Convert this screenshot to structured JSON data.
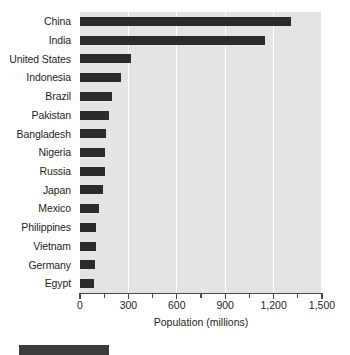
{
  "chart_data": {
    "type": "bar",
    "orientation": "horizontal",
    "title": "",
    "xlabel": "Population (millions)",
    "ylabel": "",
    "xlim": [
      0,
      1500
    ],
    "xticks": [
      0,
      300,
      600,
      900,
      1200,
      1500
    ],
    "xtick_labels": [
      "0",
      "300",
      "600",
      "900",
      "1,200",
      "1,500"
    ],
    "minor_xticks": [
      150,
      450,
      750,
      1050,
      1350
    ],
    "grid": "vertical-major-only",
    "legend": "none",
    "categories": [
      "China",
      "India",
      "United States",
      "Indonesia",
      "Brazil",
      "Pakistan",
      "Bangladesh",
      "Nigeria",
      "Russia",
      "Japan",
      "Mexico",
      "Philippines",
      "Vietnam",
      "Germany",
      "Egypt"
    ],
    "values": [
      1308,
      1147,
      316,
      254,
      198,
      180,
      161,
      155,
      152,
      143,
      118,
      100,
      98,
      93,
      87
    ],
    "bar_color": "#2b2b2b",
    "plot_background": "#e4e4e4",
    "gridline_color": "#ffffff",
    "axis_color": "#4a4a4a",
    "text_color": "#231f20"
  }
}
